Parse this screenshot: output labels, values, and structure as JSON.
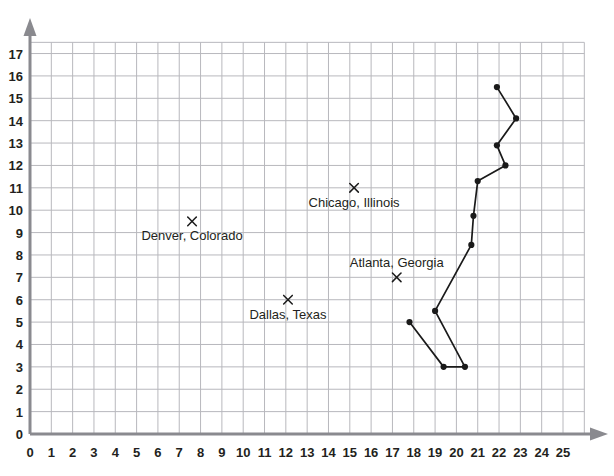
{
  "chart_data": {
    "type": "scatter",
    "title": "",
    "subtitle": "",
    "xlabel": "",
    "ylabel": "",
    "xlim": [
      0,
      25
    ],
    "ylim": [
      0,
      17
    ],
    "grid": true,
    "legend": "none",
    "x_ticks": [
      "0",
      "1",
      "2",
      "3",
      "4",
      "5",
      "6",
      "7",
      "8",
      "9",
      "10",
      "11",
      "12",
      "13",
      "14",
      "15",
      "16",
      "17",
      "18",
      "19",
      "20",
      "21",
      "22",
      "23",
      "24",
      "25"
    ],
    "y_ticks": [
      "0",
      "1",
      "2",
      "3",
      "4",
      "5",
      "6",
      "7",
      "8",
      "9",
      "10",
      "11",
      "12",
      "13",
      "14",
      "15",
      "16",
      "17"
    ],
    "annotations": [
      {
        "label": "Denver, Colorado",
        "x": 7.6,
        "y": 9.5,
        "marker": "x",
        "label_position": "below"
      },
      {
        "label": "Chicago, Illinois",
        "x": 15.2,
        "y": 11.0,
        "marker": "x",
        "label_position": "below"
      },
      {
        "label": "Atlanta, Georgia",
        "x": 17.2,
        "y": 7.0,
        "marker": "x",
        "label_position": "above"
      },
      {
        "label": "Dallas, Texas",
        "x": 12.1,
        "y": 6.0,
        "marker": "x",
        "label_position": "below"
      }
    ],
    "series": [
      {
        "name": "connected-path",
        "marker": "dot",
        "points": [
          {
            "x": 17.8,
            "y": 5.0
          },
          {
            "x": 19.4,
            "y": 3.0
          },
          {
            "x": 20.4,
            "y": 3.0
          },
          {
            "x": 19.0,
            "y": 5.5
          },
          {
            "x": 20.7,
            "y": 8.45
          },
          {
            "x": 20.8,
            "y": 9.75
          },
          {
            "x": 21.0,
            "y": 11.3
          },
          {
            "x": 22.3,
            "y": 12.0
          },
          {
            "x": 21.9,
            "y": 12.9
          },
          {
            "x": 22.8,
            "y": 14.1
          },
          {
            "x": 21.9,
            "y": 15.5
          }
        ]
      }
    ],
    "colors": {
      "grid": "#b8b8bd",
      "axis": "#8a8a8f",
      "text": "#231f20",
      "marker": "#1a1a1a",
      "line": "#1a1a1a"
    }
  }
}
